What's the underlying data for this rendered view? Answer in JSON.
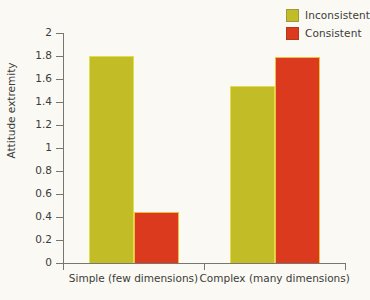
{
  "chart_data": {
    "type": "bar",
    "title": "",
    "subtitle": "",
    "xlabel": "",
    "ylabel": "Attitude extremity",
    "categories": [
      "Simple (few dimensions)",
      "Complex (many dimensions)"
    ],
    "series": [
      {
        "name": "Inconsistent",
        "color": "#c2bd27",
        "values": [
          1.8,
          1.54
        ]
      },
      {
        "name": "Consistent",
        "color": "#db3a1f",
        "values": [
          0.44,
          1.79
        ]
      }
    ],
    "ylim": [
      0,
      2
    ],
    "ytick_values": [
      0,
      0.2,
      0.4,
      0.6,
      0.8,
      1,
      1.2,
      1.4,
      1.6,
      1.8,
      2
    ],
    "ytick_labels": [
      "0",
      "0.2",
      "0.4",
      "0.6",
      "0.8",
      "1",
      "1.2",
      "1.4",
      "1.6",
      "1.8",
      "2"
    ],
    "grid": false,
    "legend_position": "top-right"
  },
  "legend": {
    "items": [
      {
        "label": "Inconsistent",
        "color": "#c2bd27"
      },
      {
        "label": "Consistent",
        "color": "#db3a1f"
      }
    ]
  },
  "axes": {
    "y_title": "Attitude extremity",
    "x_categories": [
      "Simple (few dimensions)",
      "Complex (many dimensions)"
    ]
  },
  "colors": {
    "background": "#faf9f4",
    "axis": "#77766f",
    "text": "#3c3c3a",
    "inconsistent": "#c2bd27",
    "inconsistent_edge": "#e2dc55",
    "consistent": "#db3a1f",
    "consistent_edge": "#edc23a"
  }
}
